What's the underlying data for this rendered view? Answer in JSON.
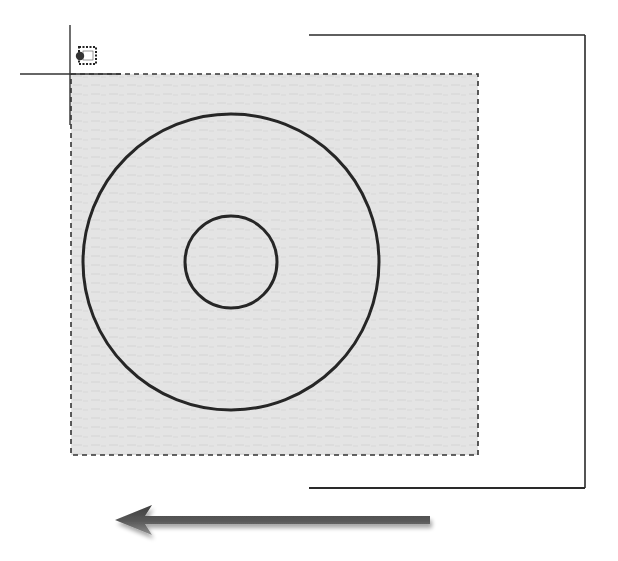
{
  "figure": {
    "background_color": "#ffffff",
    "line_color": "#2a2a2a"
  },
  "selection_window": {
    "type": "crossing",
    "style": "dashed",
    "fill_color": "#e6e6e6",
    "border_color": "#333333",
    "x": 71,
    "y": 74,
    "width": 407,
    "height": 381
  },
  "cursor": {
    "type": "crosshair",
    "x": 70,
    "y": 74,
    "icon": "crossing-selection-icon"
  },
  "objects": {
    "outer_circle": {
      "cx": 231,
      "cy": 262,
      "r": 148
    },
    "inner_circle": {
      "cx": 231,
      "cy": 262,
      "r": 46
    },
    "rectangle": {
      "x": 309,
      "y": 35,
      "width": 276,
      "height": 453
    },
    "vertical_lines": [
      {
        "x": 312,
        "y1": 35,
        "y2": 488
      },
      {
        "x": 447,
        "y1": 35,
        "y2": 488
      }
    ]
  },
  "direction_arrow": {
    "direction": "left",
    "x1": 430,
    "x2": 115,
    "y": 520,
    "color_dark": "#4a4a4a",
    "color_light": "#9a9a9a"
  }
}
